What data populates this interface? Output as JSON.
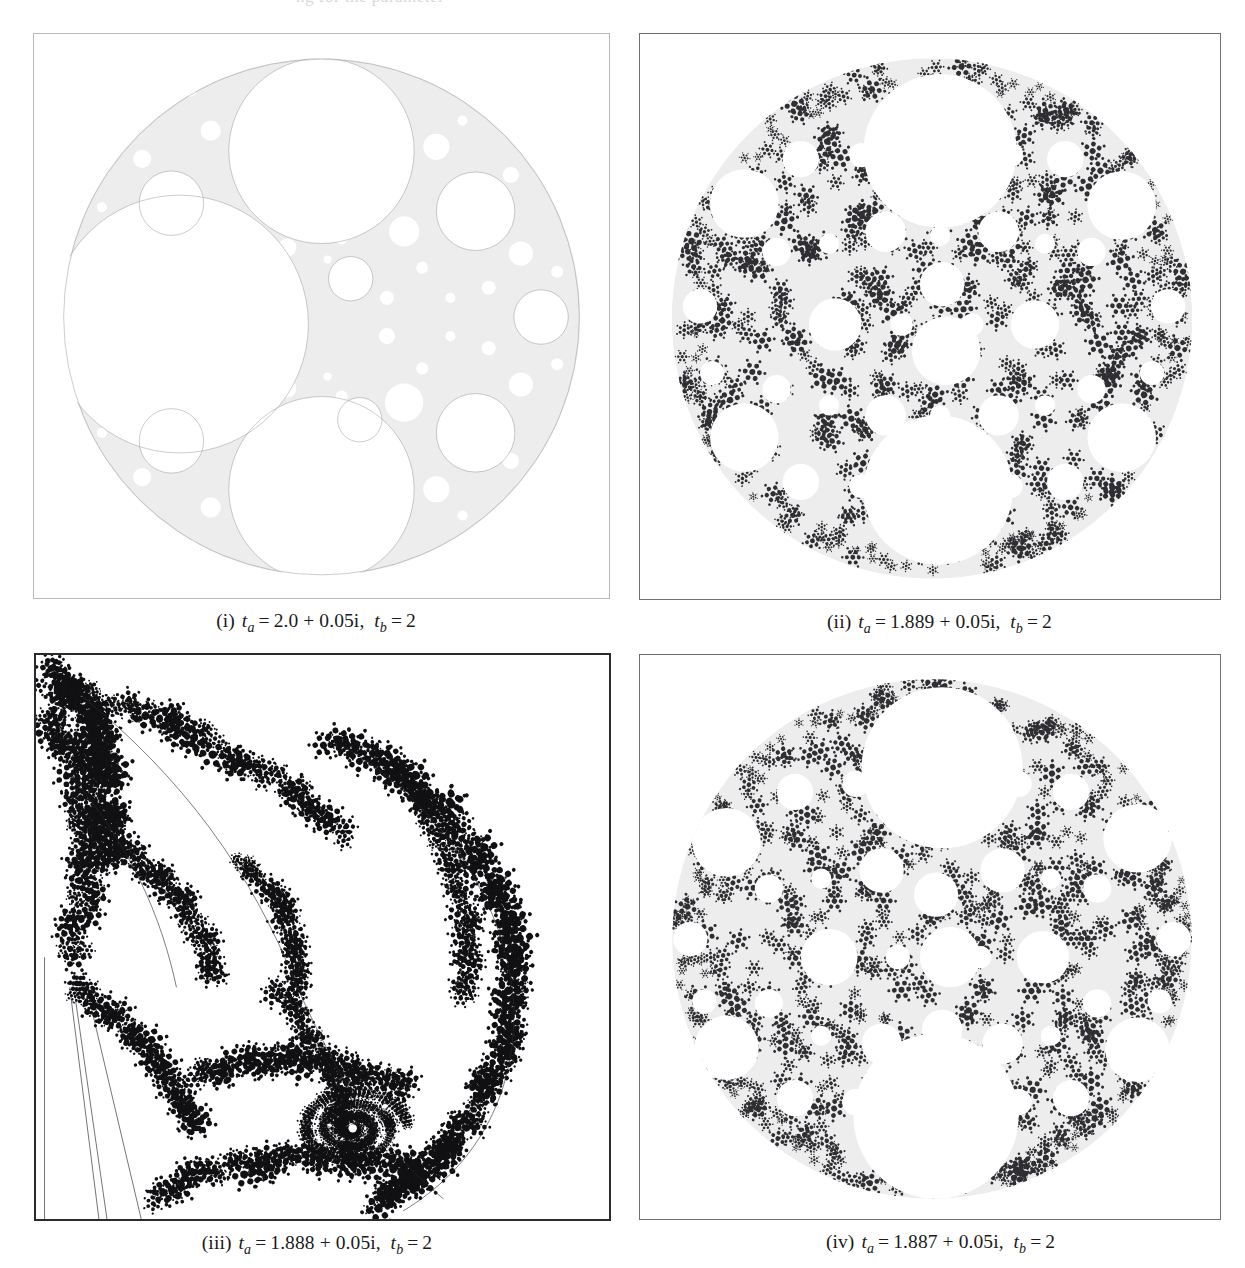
{
  "figure": {
    "top_bleed_text": "ng for the parameter",
    "panels": [
      {
        "id": "panel-i",
        "label": "(i)",
        "ta_symbol": "t",
        "ta_sub": "a",
        "tb_symbol": "t",
        "tb_sub": "b",
        "eq": "=",
        "ta_value": "2.0 + 0.05i",
        "comma": ",",
        "tb_value": "2",
        "caption_plain": "(i) t_a = 2.0 + 0.05i, t_b = 2",
        "style": "gasket-light",
        "fill_color": "#ededed",
        "ink_color": "#2f2f33",
        "frame_style": "thin"
      },
      {
        "id": "panel-ii",
        "label": "(ii)",
        "ta_symbol": "t",
        "ta_sub": "a",
        "tb_symbol": "t",
        "tb_sub": "b",
        "eq": "=",
        "ta_value": "1.889 + 0.05i",
        "comma": ",",
        "tb_value": "2",
        "caption_plain": "(ii) t_a = 1.889 + 0.05i, t_b = 2",
        "style": "gasket-speckled",
        "fill_color": "#ededed",
        "ink_color": "#2f2f33",
        "frame_style": "medium"
      },
      {
        "id": "panel-iii",
        "label": "(iii)",
        "ta_symbol": "t",
        "ta_sub": "a",
        "tb_symbol": "t",
        "tb_sub": "b",
        "eq": "=",
        "ta_value": "1.888 + 0.05i",
        "comma": ",",
        "tb_value": "2",
        "caption_plain": "(iii) t_a = 1.888 + 0.05i, t_b = 2",
        "style": "exploded-black",
        "fill_color": "#ffffff",
        "ink_color": "#111114",
        "frame_style": "dark"
      },
      {
        "id": "panel-iv",
        "label": "(iv)",
        "ta_symbol": "t",
        "ta_sub": "a",
        "tb_symbol": "t",
        "tb_sub": "b",
        "eq": "=",
        "ta_value": "1.887 + 0.05i",
        "comma": ",",
        "tb_value": "2",
        "caption_plain": "(iv) t_a = 1.887 + 0.05i, t_b = 2",
        "style": "gasket-dense",
        "fill_color": "#ededed",
        "ink_color": "#2f2f33",
        "frame_style": "medium"
      }
    ]
  }
}
